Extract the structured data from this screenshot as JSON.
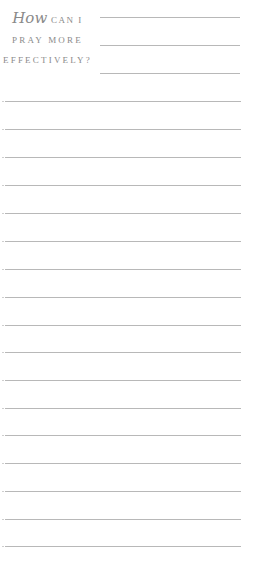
{
  "heading": {
    "word_how": "How",
    "line1_rest": "CAN I",
    "line2": "PRAY MORE",
    "line3": "EFFECTIVELY?"
  },
  "colors": {
    "text": "#8a8a8a",
    "rule": "#b8b8b8"
  },
  "short_lines": [
    17,
    45,
    73
  ],
  "full_lines": [
    101,
    129,
    157,
    185,
    213,
    241,
    269,
    297,
    325,
    352,
    380,
    408,
    435,
    463,
    491,
    519,
    546
  ]
}
